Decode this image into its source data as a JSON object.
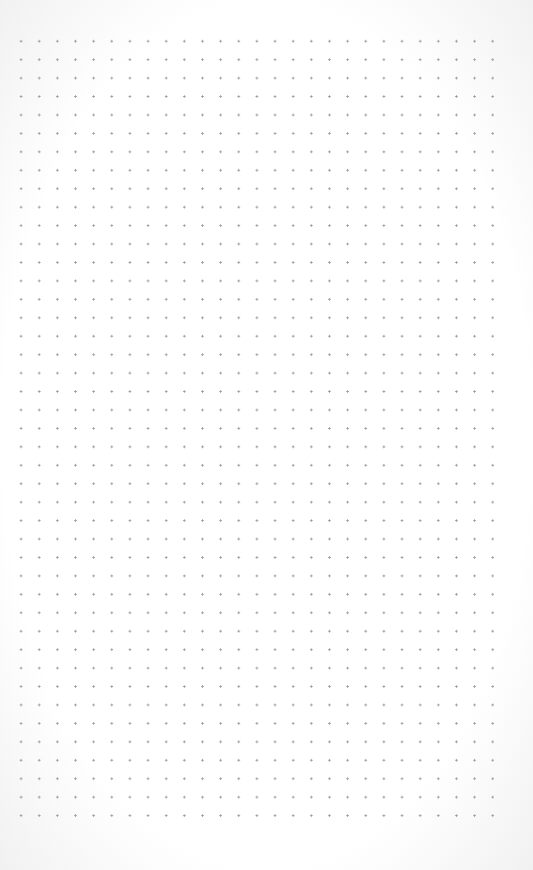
{
  "page": {
    "type": "dot-grid-paper",
    "columns": 27,
    "rows": 44,
    "dot_color": "#9a9a9a",
    "background_color": "#ffffff"
  }
}
